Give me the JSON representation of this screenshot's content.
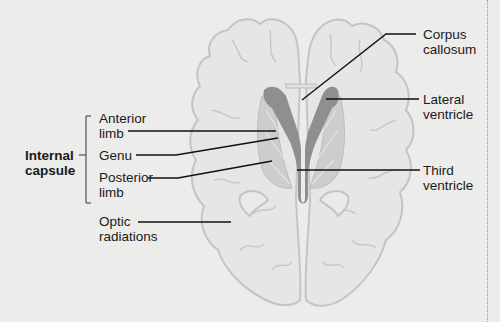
{
  "figure": {
    "type": "anatomical-diagram",
    "labels": {
      "internal_capsule": [
        "Internal",
        "capsule"
      ],
      "anterior_limb": [
        "Anterior",
        "limb"
      ],
      "genu": [
        "Genu"
      ],
      "posterior_limb": [
        "Posterior",
        "limb"
      ],
      "optic_radiations": [
        "Optic",
        "radiations"
      ],
      "corpus_callosum": [
        "Corpus",
        "callosum"
      ],
      "lateral_ventricle": [
        "Lateral",
        "ventricle"
      ],
      "third_ventricle": [
        "Third",
        "ventricle"
      ]
    },
    "colors": {
      "background": "#ececea",
      "brain_fill": "#e6e6e4",
      "brain_outline": "#c4c4c2",
      "ventricle": "#8f8f8f",
      "capsule_fill": "#cdcdcb",
      "leader_line": "#111111"
    }
  }
}
